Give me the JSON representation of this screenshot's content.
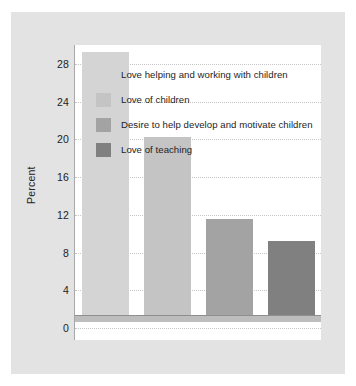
{
  "chart_data": {
    "type": "bar",
    "title": "",
    "subtitle": "",
    "xlabel": "",
    "ylabel": "Percent",
    "categories": [
      "Love helping and working with children",
      "Love of children",
      "Desire to help develop and motivate children",
      "Love of teaching"
    ],
    "values": [
      28,
      19,
      10.3,
      8
    ],
    "series": [
      {
        "name": "Percent",
        "values": [
          28,
          19,
          10.3,
          8
        ]
      }
    ],
    "ylim": [
      0,
      30
    ],
    "yticks": [
      0,
      4,
      8,
      12,
      16,
      20,
      24,
      28
    ],
    "ytick_labels": [
      "0",
      "4",
      "8",
      "12",
      "16",
      "20",
      "24",
      "28"
    ],
    "xtick_labels": [
      "",
      "",
      "",
      ""
    ],
    "grid": true,
    "grid_axis": "y",
    "grid_style": "dotted",
    "legend_position": "upper-left-inside",
    "bar_colors": [
      "#d4d4d4",
      "#c4c4c4",
      "#a3a3a3",
      "#808080"
    ],
    "legend": [
      {
        "label": "Love helping and working with children",
        "color": "#d4d4d4"
      },
      {
        "label": "Love of children",
        "color": "#c4c4c4"
      },
      {
        "label": "Desire to help develop and motivate children",
        "color": "#a3a3a3"
      },
      {
        "label": "Love of teaching",
        "color": "#808080"
      }
    ]
  },
  "colors": {
    "page_background": "#ffffff",
    "panel_background": "#e3e3e3",
    "plot_background": "#ffffff",
    "axis_line": "#8e8e8e",
    "gridline": "#c6c6c6",
    "text": "#1d1d1d"
  }
}
